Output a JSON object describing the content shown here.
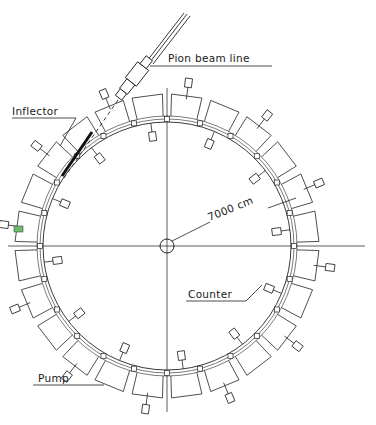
{
  "diagram": {
    "type": "technical drawing",
    "labels": {
      "pion_beam_line": "Pion  beam  line",
      "inflector": "Inflector",
      "radius": "7000 cm",
      "counter": "Counter",
      "pump": "Pump"
    },
    "geometry": {
      "center_x": 167,
      "center_y": 246,
      "outer_radius": 152,
      "inner_radius": 124,
      "segment_count": 24
    },
    "colors": {
      "line": "#222222",
      "background": "#ffffff",
      "marker": "#6bbf6b"
    }
  }
}
